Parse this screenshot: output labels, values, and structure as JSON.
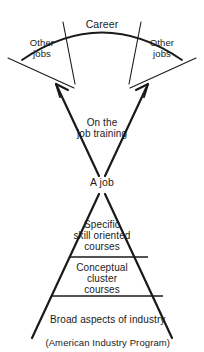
{
  "diagram": {
    "type": "hourglass-progression-diagram",
    "stroke_color": "#1a1a1a",
    "background_color": "#ffffff",
    "text_color": "#1a1a1a",
    "top_fan": {
      "career_label": "Career",
      "other_jobs_left": "Other\njobs",
      "other_jobs_right": "Other\njobs"
    },
    "middle": {
      "training_label": "On the\njob training",
      "job_label": "A job"
    },
    "pyramid": {
      "tier_top": "Specific\nskill oriented\ncourses",
      "tier_middle": "Conceptual\ncluster\ncourses",
      "tier_bottom_line1": "Broad aspects of industry",
      "tier_bottom_line2": "(American Industry Program)"
    }
  }
}
